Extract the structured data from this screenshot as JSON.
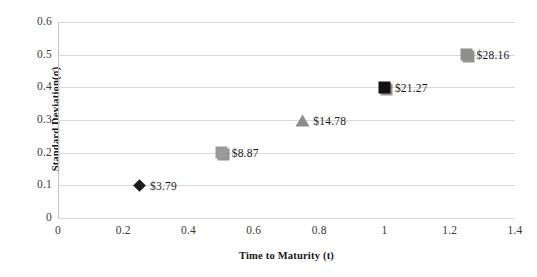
{
  "chart_data": {
    "type": "scatter",
    "title": "",
    "xlabel": "Time to Maturity (t)",
    "ylabel": "Standard Deviation(σ)",
    "xlim": [
      0,
      1.4
    ],
    "ylim": [
      0,
      0.6
    ],
    "grid": "horizontal",
    "legend": "none",
    "xticks": [
      "0",
      "0.2",
      "0.4",
      "0.6",
      "0.8",
      "1",
      "1.2",
      "1.4"
    ],
    "xtick_values": [
      0,
      0.2,
      0.4,
      0.6,
      0.8,
      1,
      1.2,
      1.4
    ],
    "yticks": [
      "0",
      "0.1",
      "0.2",
      "0.3",
      "0.4",
      "0.5",
      "0.6"
    ],
    "ytick_values": [
      0,
      0.1,
      0.2,
      0.3,
      0.4,
      0.5,
      0.6
    ],
    "points": [
      {
        "x": 0.25,
        "y": 0.1,
        "label": "$3.79",
        "marker": "diamond",
        "color": "#1a1a1a"
      },
      {
        "x": 0.5,
        "y": 0.2,
        "label": "$8.87",
        "marker": "square",
        "color": "#9a9a9a"
      },
      {
        "x": 0.75,
        "y": 0.3,
        "label": "$14.78",
        "marker": "triangle",
        "color": "#8c8c8c"
      },
      {
        "x": 1.0,
        "y": 0.4,
        "label": "$21.27",
        "marker": "square",
        "color": "#111111"
      },
      {
        "x": 1.25,
        "y": 0.5,
        "label": "$28.16",
        "marker": "square",
        "color": "#8f8f8f"
      }
    ],
    "gridline_color": "#d9d9d9",
    "axis_color": "#bfbfbf",
    "background": "#ffffff"
  }
}
